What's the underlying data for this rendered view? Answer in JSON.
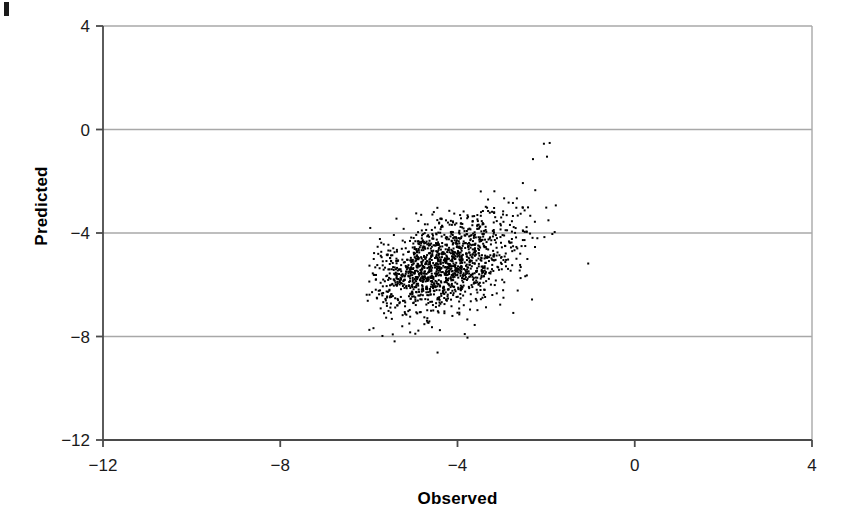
{
  "figure": {
    "background_color": "#ffffff",
    "artifact": {
      "name": "page-edge-mark",
      "color": "#1a1a1a"
    }
  },
  "chart_data": {
    "type": "scatter",
    "title": "",
    "xlabel": "Observed",
    "ylabel": "Predicted",
    "xlim": [
      -12,
      4
    ],
    "ylim": [
      -12,
      4
    ],
    "xticks": [
      -12,
      -8,
      -4,
      0,
      4
    ],
    "yticks": [
      -12,
      -8,
      -4,
      0,
      4
    ],
    "xtick_labels": [
      "-12",
      "-8",
      "-4",
      "0",
      "4"
    ],
    "ytick_labels": [
      "-12",
      "-8",
      "-4",
      "0",
      "4"
    ],
    "grid": "horizontal",
    "gridlines_y": [
      0,
      -4,
      -8
    ],
    "legend": "none",
    "marker": {
      "shape": "square",
      "size_px": 2,
      "color": "#000000"
    },
    "axis_color": "#4a4a4a",
    "grid_color": "#a8a8a8",
    "n_points": 1450,
    "cluster": {
      "x_range": [
        -6.05,
        -1.75
      ],
      "y_range": [
        -8.35,
        -0.45
      ],
      "x_mean": -4.3,
      "y_mean": -5.25,
      "x_sd": 0.85,
      "y_sd": 0.95,
      "correlation": 0.45,
      "description": "Dense elongated cloud of predicted-vs-observed points centred near (-4.3, -5.3), sloping upward to the right; sparse lower tail crossing the -8 gridline."
    },
    "outliers": [
      {
        "x": -2.05,
        "y": -0.55
      },
      {
        "x": -1.92,
        "y": -0.52
      },
      {
        "x": -1.98,
        "y": -1.05
      },
      {
        "x": -1.05,
        "y": -5.18
      },
      {
        "x": -4.45,
        "y": -8.62
      }
    ]
  }
}
